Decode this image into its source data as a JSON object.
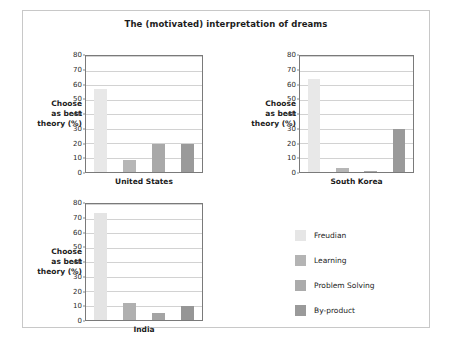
{
  "chart_data": {
    "type": "bar",
    "title": "The (motivated) interpretation of dreams",
    "xlabel": "",
    "ylabel": "Choose as best theory (%)",
    "ylim": [
      0,
      80
    ],
    "ytick_labels": [
      "80",
      "70",
      "60",
      "50",
      "40",
      "30",
      "20",
      "10",
      "0"
    ],
    "ytick_values": [
      80,
      70,
      60,
      50,
      40,
      30,
      20,
      10,
      0
    ],
    "grid": true,
    "legend_position": "bottom-right",
    "categories": [
      "Freudian",
      "Learning",
      "Problem Solving",
      "By-product"
    ],
    "series": [
      {
        "name": "United States",
        "values": [
          57,
          8,
          19,
          19
        ]
      },
      {
        "name": "South Korea",
        "values": [
          64,
          3,
          1,
          30
        ]
      },
      {
        "name": "India",
        "values": [
          74,
          12,
          5,
          10
        ]
      }
    ],
    "panels": [
      {
        "id": "united-states",
        "xlabel": "United States",
        "ylabel_lines": [
          "Choose",
          "as best",
          "theory (%)"
        ],
        "bars": [
          {
            "label": "Freudian",
            "value": 57,
            "color": "#e8e8e8"
          },
          {
            "label": "Learning",
            "value": 8,
            "color": "#b6b6b6"
          },
          {
            "label": "Problem Solving",
            "value": 19,
            "color": "#a9a9a9"
          },
          {
            "label": "By-product",
            "value": 19,
            "color": "#9a9a9a"
          }
        ]
      },
      {
        "id": "south-korea",
        "xlabel": "South Korea",
        "ylabel_lines": [
          "Choose",
          "as best",
          "theory (%)"
        ],
        "bars": [
          {
            "label": "Freudian",
            "value": 64,
            "color": "#e8e8e8"
          },
          {
            "label": "Learning",
            "value": 3,
            "color": "#b6b6b6"
          },
          {
            "label": "Problem Solving",
            "value": 1,
            "color": "#a9a9a9"
          },
          {
            "label": "By-product",
            "value": 30,
            "color": "#9a9a9a"
          }
        ]
      },
      {
        "id": "india",
        "xlabel": "India",
        "ylabel_lines": [
          "Choose",
          "as best",
          "theory (%)"
        ],
        "bars": [
          {
            "label": "Freudian",
            "value": 74,
            "color": "#e4e4e4"
          },
          {
            "label": "Learning",
            "value": 12,
            "color": "#b0b0b0"
          },
          {
            "label": "Problem Solving",
            "value": 5,
            "color": "#a4a4a4"
          },
          {
            "label": "By-product",
            "value": 10,
            "color": "#969696"
          }
        ]
      }
    ],
    "legend": [
      {
        "label": "Freudian",
        "color": "#e6e6e6"
      },
      {
        "label": "Learning",
        "color": "#b4b4b4"
      },
      {
        "label": "Problem Solving",
        "color": "#ababab"
      },
      {
        "label": "By-product",
        "color": "#9a9a9a"
      }
    ]
  }
}
